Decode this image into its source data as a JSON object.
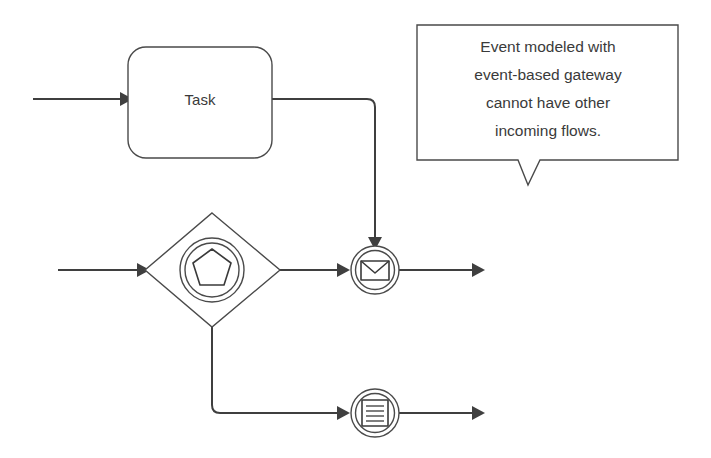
{
  "diagram": {
    "background_color": "#ffffff",
    "line_color": "#3f3f3f",
    "shape_stroke_color": "#4a4a4a",
    "text_color": "#3a3a3a"
  },
  "nodes": {
    "task": {
      "label": "Task",
      "type": "task",
      "x": 128,
      "y": 47,
      "width": 144,
      "height": 111
    },
    "gateway": {
      "label": "",
      "type": "event-based-gateway",
      "center_x": 212,
      "center_y": 270,
      "half_width": 68,
      "half_height": 57,
      "marker": "pentagon"
    },
    "message_event": {
      "label": "",
      "type": "intermediate-message-event",
      "center_x": 375,
      "center_y": 270,
      "radius": 24,
      "marker": "envelope"
    },
    "conditional_event": {
      "label": "",
      "type": "intermediate-conditional-event",
      "center_x": 375,
      "center_y": 413,
      "radius": 24,
      "marker": "conditional-lines"
    }
  },
  "flows": [
    {
      "name": "incoming-flow-to-task",
      "from": "start",
      "to": "task"
    },
    {
      "name": "incoming-flow-to-gateway",
      "from": "start",
      "to": "gateway"
    },
    {
      "name": "flow-task-to-message-event",
      "from": "task",
      "to": "message_event"
    },
    {
      "name": "flow-gateway-to-message-event",
      "from": "gateway",
      "to": "message_event"
    },
    {
      "name": "flow-gateway-to-conditional-event",
      "from": "gateway",
      "to": "conditional_event"
    },
    {
      "name": "outgoing-flow-from-message-event",
      "from": "message_event",
      "to": "end"
    },
    {
      "name": "outgoing-flow-from-conditional-event",
      "from": "conditional_event",
      "to": "end"
    }
  ],
  "callout": {
    "lines": [
      "Event modeled with",
      "event-based gateway",
      "cannot have other",
      "incoming flows."
    ],
    "text": "Event modeled with event-based gateway cannot have other incoming flows.",
    "x": 417,
    "y": 25,
    "width": 261,
    "height": 135
  }
}
